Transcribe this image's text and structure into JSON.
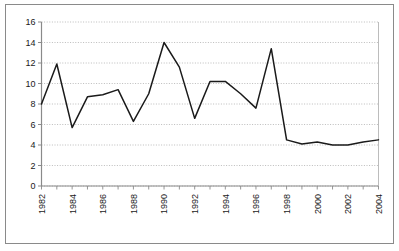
{
  "chart_data": {
    "type": "line",
    "title": "",
    "subtitle": "",
    "xlabel": "",
    "ylabel": "",
    "x": [
      1982,
      1983,
      1984,
      1985,
      1986,
      1987,
      1988,
      1989,
      1990,
      1991,
      1992,
      1993,
      1994,
      1995,
      1996,
      1997,
      1998,
      1999,
      2000,
      2001,
      2002,
      2003,
      2004
    ],
    "values": [
      8.0,
      11.9,
      5.7,
      8.7,
      8.9,
      9.4,
      6.3,
      9.0,
      14.0,
      11.6,
      6.6,
      10.2,
      10.2,
      9.0,
      7.6,
      13.4,
      4.5,
      4.1,
      4.3,
      4.0,
      4.0,
      4.3,
      4.5
    ],
    "series": [
      {
        "name": "series-1",
        "values": [
          8.0,
          11.9,
          5.7,
          8.7,
          8.9,
          9.4,
          6.3,
          9.0,
          14.0,
          11.6,
          6.6,
          10.2,
          10.2,
          9.0,
          7.6,
          13.4,
          4.5,
          4.1,
          4.3,
          4.0,
          4.0,
          4.3,
          4.5
        ]
      }
    ],
    "ylim": [
      0,
      16
    ],
    "xlim": [
      1982,
      2004
    ],
    "ytick_labels": [
      "0",
      "2",
      "4",
      "6",
      "8",
      "10",
      "12",
      "14",
      "16"
    ],
    "ytick_values": [
      0,
      2,
      4,
      6,
      8,
      10,
      12,
      14,
      16
    ],
    "xtick_labels": [
      "1982",
      "1984",
      "1986",
      "1988",
      "1990",
      "1992",
      "1994",
      "1996",
      "1998",
      "2000",
      "2002",
      "2004"
    ],
    "xtick_values": [
      1982,
      1984,
      1986,
      1988,
      1990,
      1992,
      1994,
      1996,
      1998,
      2000,
      2002,
      2004
    ],
    "xtick_rotation": 90,
    "grid": "horizontal-dotted",
    "legend": "none",
    "line_color": "#1a1a1a",
    "grid_color": "#b4b4b4",
    "axis_color": "#8a8a8a",
    "background_color": "#ffffff",
    "markers": "none"
  }
}
